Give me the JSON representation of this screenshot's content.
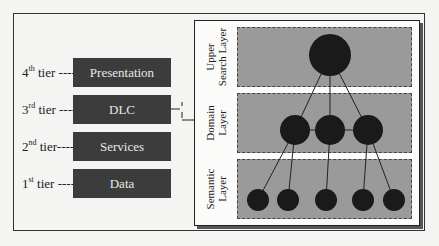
{
  "tiers": [
    {
      "num": "4",
      "suffix": "th",
      "word": "tier",
      "label": "Presentation"
    },
    {
      "num": "3",
      "suffix": "rd",
      "word": "tier",
      "label": "DLC"
    },
    {
      "num": "2",
      "suffix": "nd",
      "word": "tier",
      "label": "Services"
    },
    {
      "num": "1",
      "suffix": "st",
      "word": "tier",
      "label": "Data"
    }
  ],
  "layers": [
    {
      "line1": "Upper",
      "line2": "Search Layer"
    },
    {
      "line1": "Domain",
      "line2": "Layer"
    },
    {
      "line1": "Semantic",
      "line2": "Layer"
    }
  ],
  "graph": {
    "node_color": "#1a1a1a",
    "layer_color": "#9a9a9a",
    "tier_box_color": "#3c3c3c",
    "nodes": {
      "upper": 1,
      "domain": 3,
      "semantic": 5
    }
  }
}
